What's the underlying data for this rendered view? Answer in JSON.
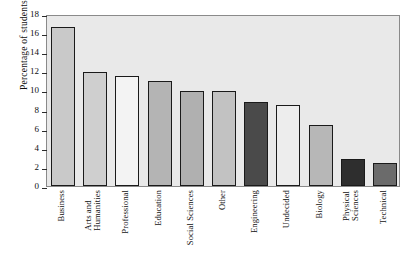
{
  "chart_data": {
    "type": "bar",
    "title": "",
    "xlabel": "",
    "ylabel": "Percentage of students",
    "ylim": [
      0,
      18
    ],
    "ytick_step": 2,
    "yticks": [
      "18",
      "16",
      "14",
      "12",
      "10",
      "8",
      "6",
      "4",
      "2",
      "0"
    ],
    "grid": false,
    "legend": "none",
    "categories": [
      "Business",
      "Arts and Humanities",
      "Professional",
      "Education",
      "Social Sciences",
      "Other",
      "Engineering",
      "Undecided",
      "Biology",
      "Physical Sciences",
      "Technical"
    ],
    "category_lines": [
      [
        "Business"
      ],
      [
        "Arts and",
        "Humanities"
      ],
      [
        "Professional"
      ],
      [
        "Education"
      ],
      [
        "Social Sciences"
      ],
      [
        "Other"
      ],
      [
        "Engineering"
      ],
      [
        "Undecided"
      ],
      [
        "Biology"
      ],
      [
        "Physical",
        "Sciences"
      ],
      [
        "Technical"
      ]
    ],
    "values": [
      16.8,
      12.1,
      11.6,
      11.1,
      10.1,
      10.1,
      8.9,
      8.6,
      6.5,
      2.9,
      2.4
    ],
    "bar_colors": [
      "#c9c9c9",
      "#cfcfcf",
      "#f3f3f3",
      "#b4b4b4",
      "#b0b0b0",
      "#c2c2c2",
      "#4a4a4a",
      "#ededed",
      "#b7b7b7",
      "#2e2e2e",
      "#6b6b6b"
    ]
  },
  "style": {
    "plot_background": "#e9e9e9",
    "frame_color": "#8a8a8a",
    "bar_outline": "#1a1a1a",
    "page_background": "#ffffff"
  }
}
